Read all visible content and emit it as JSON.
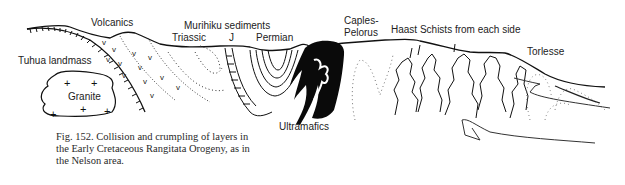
{
  "diagram": {
    "labels": {
      "volcanics": "Volcanics",
      "murihiku": "Murihiku sediments",
      "triassic": "Triassic",
      "jurassic": "J",
      "permian": "Permian",
      "caples": "Caples-",
      "pelorus": "Pelorus",
      "haast": "Haast Schists from each side",
      "torlesse": "Torlesse",
      "tuhua": "Tuhua landmass",
      "granite": "Granite",
      "ultramafics": "Ultramafics"
    },
    "caption": {
      "line1": "Fig. 152. Collision and crumpling of layers in",
      "line2": "the Early Cretaceous Rangitata Orogeny, as in",
      "line3": "the Nelson area."
    },
    "arrow": {
      "direction": "up-left",
      "meaning": "collision direction"
    }
  }
}
